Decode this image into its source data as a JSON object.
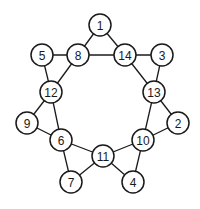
{
  "diagram": {
    "type": "graph",
    "node_radius": 11,
    "colors": {
      "stroke": "#1a1a1a",
      "fill": "#ffffff",
      "background": "#ffffff"
    },
    "nodes": [
      {
        "id": "1",
        "label": "1",
        "x": 100,
        "y": 25
      },
      {
        "id": "5",
        "label": "5",
        "x": 42,
        "y": 55
      },
      {
        "id": "8",
        "label": "8",
        "x": 78,
        "y": 55
      },
      {
        "id": "14",
        "label": "14",
        "x": 125,
        "y": 55
      },
      {
        "id": "3",
        "label": "3",
        "x": 162,
        "y": 55
      },
      {
        "id": "12",
        "label": "12",
        "x": 51,
        "y": 92
      },
      {
        "id": "13",
        "label": "13",
        "x": 154,
        "y": 92
      },
      {
        "id": "9",
        "label": "9",
        "x": 27,
        "y": 123
      },
      {
        "id": "2",
        "label": "2",
        "x": 178,
        "y": 123
      },
      {
        "id": "6",
        "label": "6",
        "x": 61,
        "y": 140
      },
      {
        "id": "10",
        "label": "10",
        "x": 143,
        "y": 140
      },
      {
        "id": "11",
        "label": "11",
        "x": 103,
        "y": 156
      },
      {
        "id": "7",
        "label": "7",
        "x": 71,
        "y": 182
      },
      {
        "id": "4",
        "label": "4",
        "x": 133,
        "y": 182
      }
    ],
    "edges": [
      [
        "1",
        "8"
      ],
      [
        "1",
        "14"
      ],
      [
        "8",
        "14"
      ],
      [
        "5",
        "8"
      ],
      [
        "5",
        "12"
      ],
      [
        "8",
        "12"
      ],
      [
        "14",
        "3"
      ],
      [
        "14",
        "13"
      ],
      [
        "3",
        "13"
      ],
      [
        "12",
        "9"
      ],
      [
        "12",
        "6"
      ],
      [
        "9",
        "6"
      ],
      [
        "13",
        "2"
      ],
      [
        "13",
        "10"
      ],
      [
        "2",
        "10"
      ],
      [
        "6",
        "11"
      ],
      [
        "6",
        "7"
      ],
      [
        "7",
        "11"
      ],
      [
        "10",
        "11"
      ],
      [
        "10",
        "4"
      ],
      [
        "4",
        "11"
      ]
    ]
  }
}
